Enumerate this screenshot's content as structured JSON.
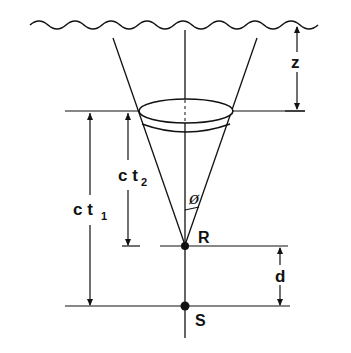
{
  "diagram": {
    "labels": {
      "z": "z",
      "ct1_main": "c t",
      "ct1_sub": "1",
      "ct2_main": "c t",
      "ct2_sub": "2",
      "phi": "ø",
      "R": "R",
      "d": "d",
      "S": "S"
    },
    "elements": [
      "wavy-surface",
      "vertical-axis",
      "cone-left-line",
      "cone-right-line",
      "upper-ellipse",
      "lower-ellipse",
      "receiver-point-R",
      "source-point-S",
      "dimension-z",
      "dimension-ct1",
      "dimension-ct2",
      "dimension-d",
      "angle-phi"
    ],
    "colors": {
      "ink": "#111111",
      "background": "#ffffff"
    }
  }
}
